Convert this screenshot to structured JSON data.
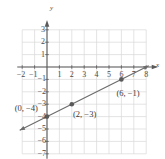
{
  "chart_data": {
    "type": "line",
    "title": "",
    "xlabel": "x",
    "ylabel": "y",
    "xlim": [
      -2.5,
      8.5
    ],
    "ylim": [
      -7.5,
      3.5
    ],
    "grid": true,
    "legend": null,
    "xticks": [
      -2,
      -1,
      1,
      2,
      3,
      4,
      5,
      6,
      7,
      8
    ],
    "xtick_labels": [
      "−2",
      "−1",
      "1",
      "2",
      "3",
      "4",
      "5",
      "6",
      "7",
      "8"
    ],
    "yticks": [
      3,
      2,
      1,
      -1,
      -2,
      -3,
      -4,
      -5,
      -6,
      -7
    ],
    "ytick_labels": [
      "3",
      "2",
      "1",
      "−1",
      "−2",
      "−3",
      "−4",
      "−5",
      "−6",
      "−7"
    ],
    "series": [
      {
        "name": "line",
        "equation": "y = 0.5x - 4",
        "slope": 0.5,
        "intercept": -4,
        "x": [
          -2.2,
          8.2
        ],
        "y": [
          -5.1,
          0.1
        ],
        "color": "#6b6b6b",
        "arrows": "both"
      }
    ],
    "points": [
      {
        "x": 0,
        "y": -4,
        "label": "(0, −4)",
        "label_x": -2.6,
        "label_y": -3.35
      },
      {
        "x": 2,
        "y": -3,
        "label": "(2, −3)",
        "label_x": 2.1,
        "label_y": -3.9
      },
      {
        "x": 6,
        "y": -1,
        "label": "(6, −1)",
        "label_x": 5.6,
        "label_y": -2.2
      }
    ],
    "colors": {
      "grid": "#d9d9d9",
      "axis": "#5a5a5a",
      "line": "#6b6b6b",
      "point": "#5a5a5a",
      "text": "#3a3a3a",
      "background": "#ffffff"
    }
  }
}
